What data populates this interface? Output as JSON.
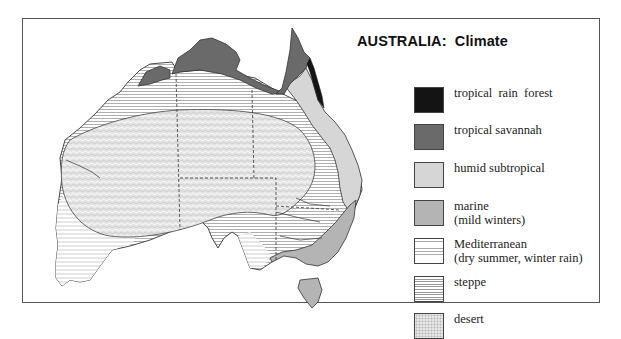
{
  "map": {
    "title": "AUSTRALIA:  Climate",
    "region": "Australia",
    "legend": [
      {
        "id": "tropical-rain-forest",
        "label": "tropical  rain  forest",
        "sublabel": "",
        "color": "#141414",
        "pattern": "solid"
      },
      {
        "id": "tropical-savannah",
        "label": "tropical savannah",
        "sublabel": "",
        "color": "#6a6a6a",
        "pattern": "solid"
      },
      {
        "id": "humid-subtropical",
        "label": "humid subtropical",
        "sublabel": "",
        "color": "#d6d6d6",
        "pattern": "solid"
      },
      {
        "id": "marine",
        "label": "marine",
        "sublabel": "(mild winters)",
        "color": "#b4b4b4",
        "pattern": "solid"
      },
      {
        "id": "mediterranean",
        "label": "Mediterranean",
        "sublabel": "(dry summer, winter rain)",
        "color": "#ffffff",
        "pattern": "sparse-horizontal-lines"
      },
      {
        "id": "steppe",
        "label": "steppe",
        "sublabel": "",
        "color": "#ffffff",
        "pattern": "dense-horizontal-lines"
      },
      {
        "id": "desert",
        "label": "desert",
        "sublabel": "",
        "color": "#e6e6e6",
        "pattern": "stipple"
      }
    ]
  }
}
